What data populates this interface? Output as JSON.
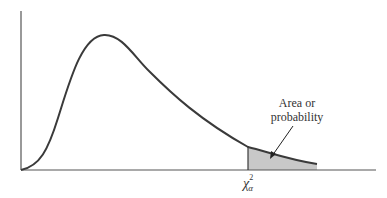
{
  "diagram": {
    "annotation": {
      "line1": "Area or",
      "line2": "probability"
    },
    "critical_value_label": {
      "symbol": "χ",
      "superscript": "2",
      "subscript": "α"
    },
    "colors": {
      "curve": "#3a3a3a",
      "axis": "#555555",
      "shaded_area": "#c8c8c8"
    }
  }
}
